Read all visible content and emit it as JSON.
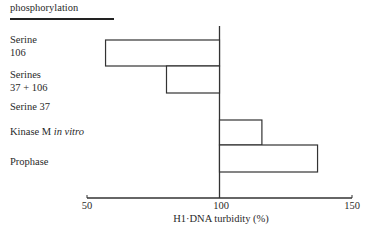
{
  "chart_data": {
    "type": "bar",
    "orientation": "horizontal",
    "baseline": 100,
    "title": "phosphorylation",
    "categories": [
      "Serine 106",
      "Serines 37 + 106",
      "Serine 37",
      "Kinase M in vitro",
      "Prophase"
    ],
    "values": [
      57,
      80,
      100,
      116,
      137
    ],
    "xlabel": "H1·DNA turbidity (%)",
    "ylabel": "",
    "xlim": [
      50,
      150
    ],
    "xticks": [
      50,
      100,
      150
    ],
    "grid": false,
    "legend": null
  },
  "header": {
    "title": "phosphorylation"
  },
  "labels": {
    "serine106_l1": "Serine",
    "serine106_l2": "106",
    "serines_l1": "Serines",
    "serines_l2": "37 + 106",
    "serine37": "Serine 37",
    "kinase_main": "Kinase M ",
    "kinase_italic": "in vitro",
    "prophase": "Prophase"
  },
  "axis": {
    "ticks": [
      "50",
      "100",
      "150"
    ],
    "xlabel": "H1·DNA turbidity (%)"
  }
}
